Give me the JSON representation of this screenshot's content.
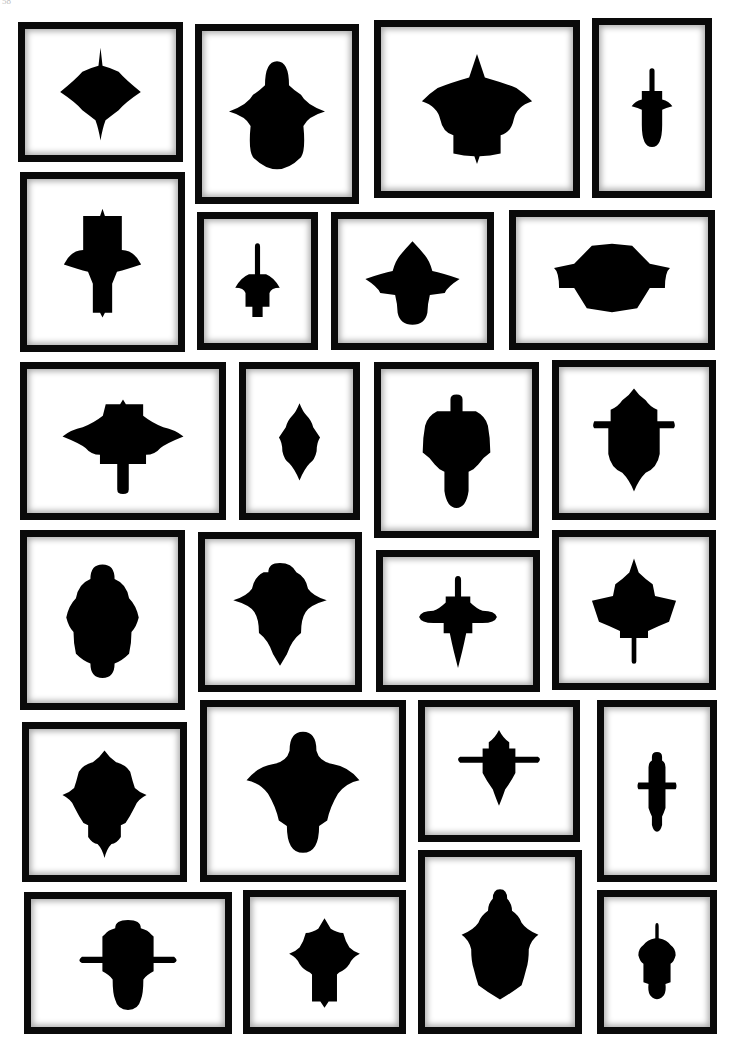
{
  "page": {
    "header_left": "58",
    "header_center": "",
    "background": "#ffffff",
    "frame_color": "#0a0a0a",
    "silhouette_color": "#000000"
  },
  "frames": [
    {
      "id": 1,
      "x": 18,
      "y": 22,
      "w": 165,
      "h": 140,
      "shape": "cusped-lobed-oval"
    },
    {
      "id": 2,
      "x": 195,
      "y": 24,
      "w": 164,
      "h": 180,
      "shape": "bell-dome"
    },
    {
      "id": 3,
      "x": 374,
      "y": 20,
      "w": 206,
      "h": 178,
      "shape": "spired-pagoda"
    },
    {
      "id": 4,
      "x": 592,
      "y": 18,
      "w": 120,
      "h": 180,
      "shape": "stem-acorn"
    },
    {
      "id": 5,
      "x": 20,
      "y": 172,
      "w": 165,
      "h": 180,
      "shape": "cross-block"
    },
    {
      "id": 6,
      "x": 197,
      "y": 212,
      "w": 121,
      "h": 138,
      "shape": "stem-urn"
    },
    {
      "id": 7,
      "x": 331,
      "y": 212,
      "w": 163,
      "h": 138,
      "shape": "cusped-cross"
    },
    {
      "id": 8,
      "x": 509,
      "y": 210,
      "w": 206,
      "h": 140,
      "shape": "octagon-band"
    },
    {
      "id": 9,
      "x": 20,
      "y": 362,
      "w": 206,
      "h": 158,
      "shape": "pagoda-stem-down"
    },
    {
      "id": 10,
      "x": 239,
      "y": 362,
      "w": 121,
      "h": 158,
      "shape": "cusped-lancet"
    },
    {
      "id": 11,
      "x": 374,
      "y": 362,
      "w": 165,
      "h": 176,
      "shape": "stem-bell-teardrop"
    },
    {
      "id": 12,
      "x": 552,
      "y": 360,
      "w": 164,
      "h": 160,
      "shape": "cusped-shield-bar"
    },
    {
      "id": 13,
      "x": 20,
      "y": 530,
      "w": 165,
      "h": 180,
      "shape": "lobed-dome"
    },
    {
      "id": 14,
      "x": 198,
      "y": 532,
      "w": 164,
      "h": 160,
      "shape": "winged-point"
    },
    {
      "id": 15,
      "x": 376,
      "y": 550,
      "w": 164,
      "h": 142,
      "shape": "stem-wing-point"
    },
    {
      "id": 16,
      "x": 552,
      "y": 530,
      "w": 164,
      "h": 160,
      "shape": "spired-kite-stem"
    },
    {
      "id": 17,
      "x": 22,
      "y": 722,
      "w": 165,
      "h": 160,
      "shape": "cusped-urn-point"
    },
    {
      "id": 18,
      "x": 200,
      "y": 700,
      "w": 206,
      "h": 182,
      "shape": "dome-wings"
    },
    {
      "id": 19,
      "x": 418,
      "y": 700,
      "w": 162,
      "h": 142,
      "shape": "cusped-cross-bar"
    },
    {
      "id": 20,
      "x": 597,
      "y": 700,
      "w": 120,
      "h": 182,
      "shape": "column-bar"
    },
    {
      "id": 21,
      "x": 24,
      "y": 892,
      "w": 208,
      "h": 142,
      "shape": "dome-cross-bar"
    },
    {
      "id": 22,
      "x": 243,
      "y": 890,
      "w": 163,
      "h": 144,
      "shape": "spired-cross"
    },
    {
      "id": 23,
      "x": 418,
      "y": 850,
      "w": 164,
      "h": 184,
      "shape": "cusped-shield"
    },
    {
      "id": 24,
      "x": 597,
      "y": 890,
      "w": 120,
      "h": 144,
      "shape": "stem-acorn-small"
    }
  ]
}
